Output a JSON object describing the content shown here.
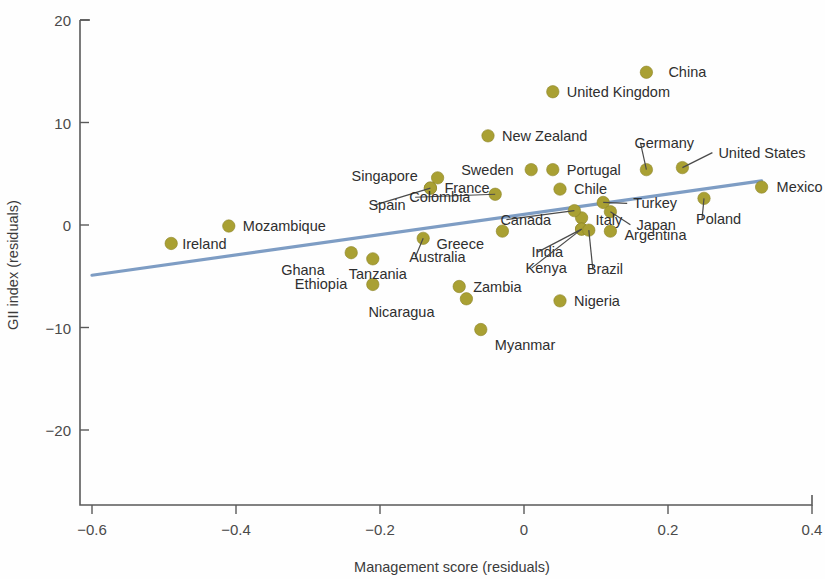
{
  "chart_data": {
    "type": "scatter",
    "title": "",
    "xlabel": "Management score (residuals)",
    "ylabel": "GII index (residuals)",
    "xlim": [
      -0.6,
      0.4
    ],
    "ylim": [
      -20,
      20
    ],
    "xticks": [
      "−0.6",
      "−0.4",
      "−0.2",
      "0",
      "0.2",
      "0.4"
    ],
    "xtick_values": [
      -0.6,
      -0.4,
      -0.2,
      0,
      0.2,
      0.4
    ],
    "yticks": [
      "20",
      "10",
      "0",
      "−10",
      "−20"
    ],
    "ytick_values": [
      20,
      10,
      0,
      -10,
      -20
    ],
    "grid": false,
    "legend": "none",
    "marker_color": "#a9a033",
    "trendline_color": "#7e9dc4",
    "trendline": {
      "x0": -0.6,
      "y0": -4.9,
      "x1": 0.33,
      "y1": 4.3
    },
    "points": [
      {
        "label": "China",
        "x": 0.17,
        "y": 14.9,
        "lx": 22,
        "ly": 5,
        "leader": false
      },
      {
        "label": "United Kingdom",
        "x": 0.04,
        "y": 13.0,
        "lx": 14,
        "ly": 5,
        "leader": false
      },
      {
        "label": "New Zealand",
        "x": -0.05,
        "y": 8.7,
        "lx": 14,
        "ly": 5,
        "leader": false
      },
      {
        "label": "Germany",
        "x": 0.17,
        "y": 5.4,
        "lx": -12,
        "ly": -22,
        "leader": true
      },
      {
        "label": "United States",
        "x": 0.22,
        "y": 5.6,
        "lx": 36,
        "ly": -10,
        "leader": true
      },
      {
        "label": "Portugal",
        "x": 0.04,
        "y": 5.4,
        "lx": 14,
        "ly": 5,
        "leader": false
      },
      {
        "label": "Sweden",
        "x": 0.01,
        "y": 5.4,
        "lx": -70,
        "ly": 5,
        "leader": false
      },
      {
        "label": "Singapore",
        "x": -0.12,
        "y": 4.6,
        "lx": -86,
        "ly": 3,
        "leader": false
      },
      {
        "label": "France",
        "x": -0.13,
        "y": 3.6,
        "lx": 14,
        "ly": 5,
        "leader": false
      },
      {
        "label": "Chile",
        "x": 0.05,
        "y": 3.5,
        "lx": 14,
        "ly": 5,
        "leader": false
      },
      {
        "label": "Spain",
        "x": -0.13,
        "y": 3.6,
        "lx": -62,
        "ly": 22,
        "leader": true
      },
      {
        "label": "Colombia",
        "x": -0.04,
        "y": 3.0,
        "lx": -86,
        "ly": 8,
        "leader": true
      },
      {
        "label": "Mexico",
        "x": 0.33,
        "y": 3.7,
        "lx": 15,
        "ly": 5,
        "leader": false
      },
      {
        "label": "Poland",
        "x": 0.25,
        "y": 2.6,
        "lx": -8,
        "ly": 26,
        "leader": true
      },
      {
        "label": "Turkey",
        "x": 0.11,
        "y": 2.2,
        "lx": 30,
        "ly": 6,
        "leader": true
      },
      {
        "label": "Japan",
        "x": 0.12,
        "y": 1.3,
        "lx": 26,
        "ly": 18,
        "leader": true
      },
      {
        "label": "Italy",
        "x": 0.08,
        "y": 0.7,
        "lx": 14,
        "ly": 7,
        "leader": false
      },
      {
        "label": "Canada",
        "x": 0.07,
        "y": 1.4,
        "lx": -74,
        "ly": 14,
        "leader": true
      },
      {
        "label": "India",
        "x": 0.08,
        "y": -0.4,
        "lx": -50,
        "ly": 28,
        "leader": true
      },
      {
        "label": "Kenya",
        "x": 0.08,
        "y": -0.4,
        "lx": -56,
        "ly": 44,
        "leader": true
      },
      {
        "label": "Brazil",
        "x": 0.09,
        "y": -0.5,
        "lx": -2,
        "ly": 44,
        "leader": true
      },
      {
        "label": "Argentina",
        "x": 0.12,
        "y": -0.6,
        "lx": 14,
        "ly": 9,
        "leader": false
      },
      {
        "label": "Greece",
        "x": -0.03,
        "y": -0.6,
        "lx": -66,
        "ly": 18,
        "leader": false
      },
      {
        "label": "Mozambique",
        "x": -0.41,
        "y": -0.1,
        "lx": 14,
        "ly": 5,
        "leader": false
      },
      {
        "label": "Australia",
        "x": -0.14,
        "y": -1.3,
        "lx": -14,
        "ly": 24,
        "leader": true
      },
      {
        "label": "Ireland",
        "x": -0.49,
        "y": -1.8,
        "lx": 11,
        "ly": 6,
        "leader": false
      },
      {
        "label": "Tanzania",
        "x": -0.21,
        "y": -3.3,
        "lx": -24,
        "ly": 20,
        "leader": false
      },
      {
        "label": "Ghana",
        "x": -0.24,
        "y": -2.7,
        "lx": -70,
        "ly": 22,
        "leader": false
      },
      {
        "label": "Ethiopia",
        "x": -0.21,
        "y": -5.8,
        "lx": -78,
        "ly": 5,
        "leader": false
      },
      {
        "label": "Zambia",
        "x": -0.09,
        "y": -6.0,
        "lx": 14,
        "ly": 5,
        "leader": false
      },
      {
        "label": "Nicaragua",
        "x": -0.08,
        "y": -7.2,
        "lx": -98,
        "ly": 18,
        "leader": false
      },
      {
        "label": "Nigeria",
        "x": 0.05,
        "y": -7.4,
        "lx": 14,
        "ly": 5,
        "leader": false
      },
      {
        "label": "Myanmar",
        "x": -0.06,
        "y": -10.2,
        "lx": 14,
        "ly": 20,
        "leader": false
      }
    ]
  }
}
